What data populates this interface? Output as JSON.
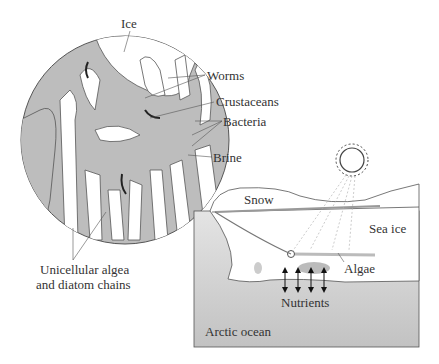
{
  "figure": {
    "magnified_view": {
      "labels": {
        "ice": "Ice",
        "worms": "Worms",
        "crustaceans": "Crustaceans",
        "bacteria": "Bacteria",
        "brine": "Brine",
        "algae_line1": "Unicellular algea",
        "algae_line2": "and diatom chains"
      }
    },
    "cross_section": {
      "labels": {
        "snow": "Snow",
        "sea_ice": "Sea ice",
        "algae": "Algae",
        "nutrients": "Nutrients",
        "ocean": "Arctic ocean"
      }
    },
    "colors": {
      "brine": "#bdbdbd",
      "ice": "#ffffff",
      "ocean_top": "#dcdcdc",
      "ocean_bottom": "#c4c4c4",
      "line": "#555555"
    }
  }
}
